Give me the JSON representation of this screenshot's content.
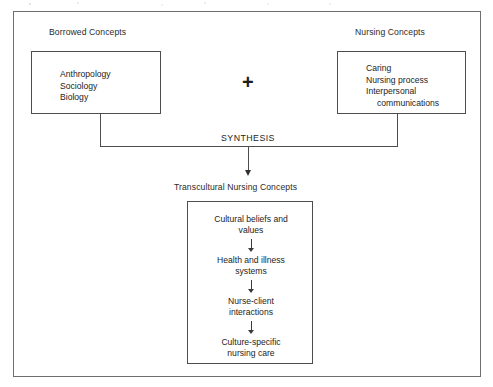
{
  "diagram": {
    "type": "conceptual-flow-diagram",
    "left_group": {
      "caption": "Borrowed Concepts",
      "items": [
        "Anthropology",
        "Sociology",
        "Biology"
      ]
    },
    "operator": "+",
    "right_group": {
      "caption": "Nursing Concepts",
      "items": [
        "Caring",
        "Nursing process",
        "Interpersonal",
        "communications"
      ]
    },
    "connector_label": "SYNTHESIS",
    "outcome": {
      "caption": "Transcultural Nursing Concepts",
      "steps": [
        {
          "line1": "Cultural beliefs and",
          "line2": "values"
        },
        {
          "line1": "Health and illness",
          "line2": "systems"
        },
        {
          "line1": "Nurse-client",
          "line2": "interactions"
        },
        {
          "line1": "Culture-specific",
          "line2": "nursing care"
        }
      ]
    },
    "colors": {
      "frame": "#6f6f72",
      "box_border": "#4d4d50",
      "text": "#1d1d1d",
      "background": "#ffffff"
    }
  }
}
